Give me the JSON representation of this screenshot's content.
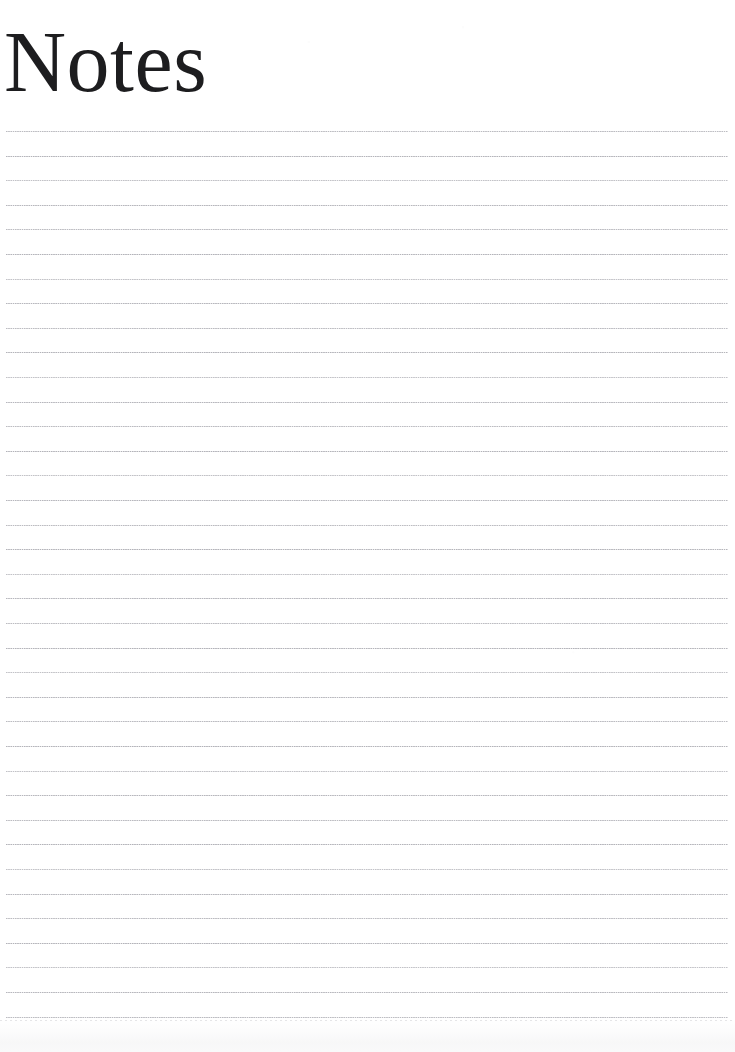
{
  "page": {
    "width": 735,
    "height": 1052,
    "background_color": "#ffffff",
    "kind": "ruled-note-page"
  },
  "header": {
    "title": "Notes",
    "title_color": "#1d1d1f",
    "title_font_style": "didone-serif",
    "title_font_size_px": 86,
    "title_left_px": 4,
    "title_baseline_y_px": 108
  },
  "ruled_area": {
    "line_count": 37,
    "first_line_y_px": 131,
    "line_spacing_px": 24.6,
    "line_left_px": 6,
    "line_right_px": 728,
    "line_width_px": 722,
    "line_thickness_px": 1,
    "line_color": "#80808a",
    "line_style": "dotted",
    "dash_period_px": 2.25
  },
  "artifacts": {
    "bottom_shade_height_px": 34,
    "bottom_shade_color": "#96969e"
  }
}
